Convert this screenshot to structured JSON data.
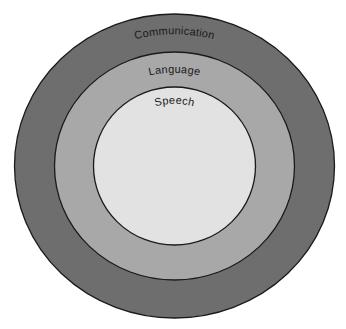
{
  "diagram": {
    "title": "",
    "type": "nested-circles",
    "background": "#ffffff",
    "center": {
      "x": 174.5,
      "y": 166
    },
    "rings": [
      {
        "id": "communication",
        "label": "Communication",
        "rx": 160,
        "ry": 152,
        "fill": "#6e6e6e"
      },
      {
        "id": "language",
        "label": "Language",
        "rx": 120,
        "ry": 114,
        "fill": "#a8a8a8"
      },
      {
        "id": "speech",
        "label": "Speech",
        "rx": 81,
        "ry": 79,
        "fill": "#e2e2e2"
      }
    ],
    "stroke_color": "#1a1a1a",
    "text_color": "#1a1a1a"
  }
}
